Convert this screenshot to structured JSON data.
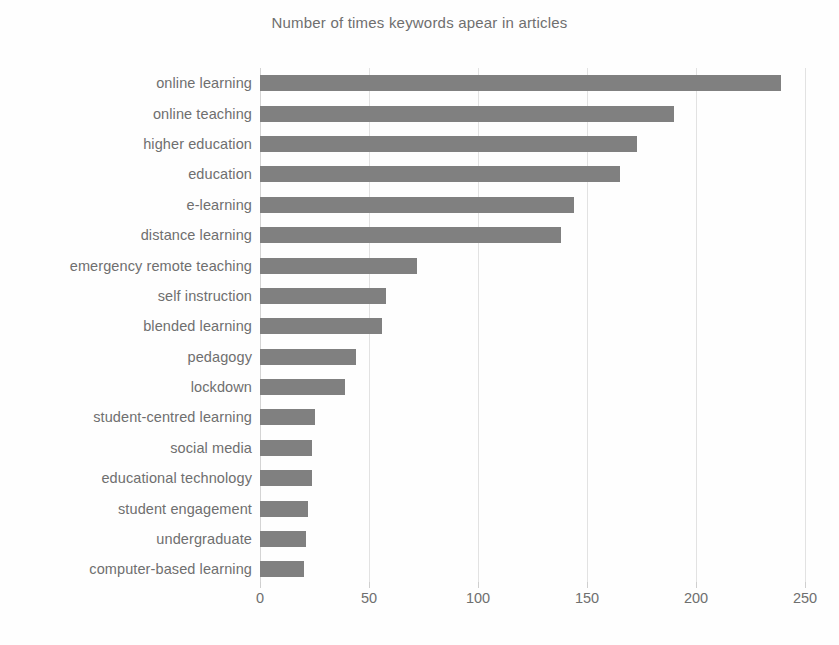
{
  "chart_data": {
    "type": "bar",
    "orientation": "horizontal",
    "title": "Number of times keywords apear in articles",
    "xlabel": "",
    "ylabel": "",
    "xlim": [
      0,
      250
    ],
    "xticks": [
      0,
      50,
      100,
      150,
      200,
      250
    ],
    "grid": true,
    "legend": false,
    "bar_color": "#808080",
    "text_color": "#6f6f6f",
    "grid_color": "#e2e2e2",
    "categories": [
      "online learning",
      "online teaching",
      "higher education",
      "education",
      "e-learning",
      "distance learning",
      "emergency remote teaching",
      "self instruction",
      "blended learning",
      "pedagogy",
      "lockdown",
      "student-centred learning",
      "social media",
      "educational technology",
      "student engagement",
      "undergraduate",
      "computer-based learning"
    ],
    "values": [
      239,
      190,
      173,
      165,
      144,
      138,
      72,
      58,
      56,
      44,
      39,
      25,
      24,
      24,
      22,
      21,
      20
    ]
  }
}
